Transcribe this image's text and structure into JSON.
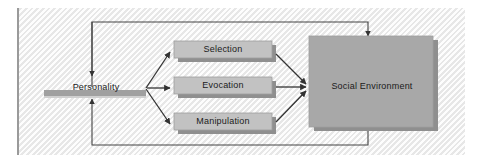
{
  "figure": {
    "type": "process-flow-diagram",
    "title": "",
    "background_color": "#f2f2f2",
    "box_fill": "#c2c2c2",
    "big_box_fill": "#a8a8a8",
    "shadow_color": "#8f8f8f",
    "line_color": "#3a3a3a",
    "bar_color": "#a0a0a0"
  },
  "nodes": {
    "personality": {
      "label": "Personality"
    },
    "selection": {
      "label": "Selection"
    },
    "evocation": {
      "label": "Evocation"
    },
    "manipulation": {
      "label": "Manipulation"
    },
    "social_environment": {
      "label": "Social Environment"
    }
  },
  "edges": [
    {
      "from": "personality",
      "to": "selection",
      "style": "arrow"
    },
    {
      "from": "personality",
      "to": "evocation",
      "style": "arrow"
    },
    {
      "from": "personality",
      "to": "manipulation",
      "style": "arrow"
    },
    {
      "from": "selection",
      "to": "social_environment",
      "style": "arrow"
    },
    {
      "from": "evocation",
      "to": "social_environment",
      "style": "arrow"
    },
    {
      "from": "manipulation",
      "to": "social_environment",
      "style": "arrow"
    },
    {
      "from": "personality",
      "to": "social_environment",
      "style": "feedback-top"
    },
    {
      "from": "social_environment",
      "to": "personality",
      "style": "feedback-bottom"
    }
  ]
}
